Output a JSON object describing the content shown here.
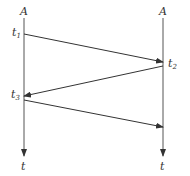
{
  "diagram": {
    "left_axis": {
      "top_label": "A",
      "bottom_label": "t"
    },
    "right_axis": {
      "top_label": "A",
      "bottom_label": "t"
    },
    "events": [
      {
        "name": "t",
        "sub": "1",
        "side": "left"
      },
      {
        "name": "t",
        "sub": "2",
        "side": "right"
      },
      {
        "name": "t",
        "sub": "3",
        "side": "left"
      }
    ],
    "line_color": "#333333"
  }
}
